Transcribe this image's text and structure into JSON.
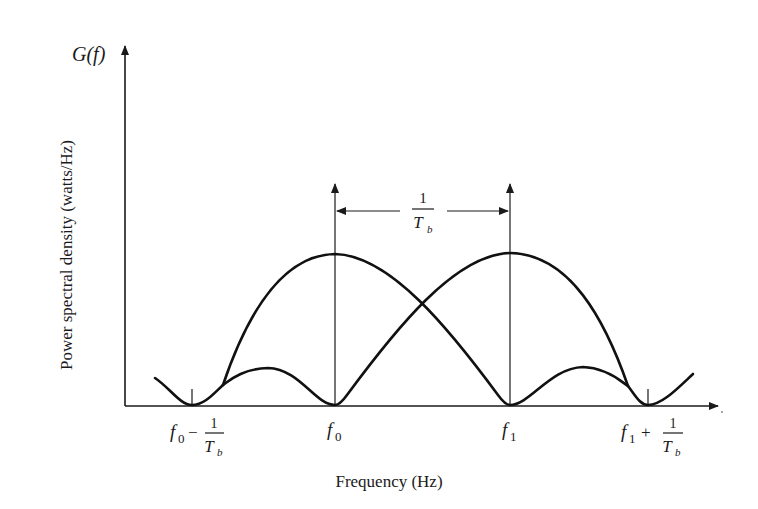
{
  "figure": {
    "y_axis_symbol": "G(f)",
    "y_axis_label": "Power spectral density (watts/Hz)",
    "x_axis_label": "Frequency (Hz)",
    "spacing_annotation": {
      "numerator": "1",
      "denominator": "T",
      "denominator_sub": "b"
    },
    "tick_labels": [
      {
        "id": "f0_minus",
        "base": "f",
        "sub": "0",
        "op": "−",
        "num": "1",
        "den": "T",
        "den_sub": "b"
      },
      {
        "id": "f0",
        "base": "f",
        "sub": "0"
      },
      {
        "id": "f1",
        "base": "f",
        "sub": "1"
      },
      {
        "id": "f1_plus",
        "base": "f",
        "sub": "1",
        "op": "+",
        "num": "1",
        "den": "T",
        "den_sub": "b"
      }
    ]
  },
  "diagram_data": {
    "type": "spectrum",
    "description": "Two overlapping sinc-squared spectral lobes centered at f0 and f1, separated by 1/Tb, with nulls at f0-1/Tb, f0, f1, f1+1/Tb",
    "carriers": [
      "f0",
      "f1"
    ],
    "carrier_separation": "1/Tb",
    "colors": {
      "line": "#111111",
      "background": "#ffffff"
    }
  }
}
